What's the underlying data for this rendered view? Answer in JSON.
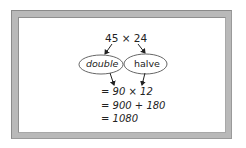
{
  "diagram": {
    "expression": "45 × 24",
    "operations": [
      {
        "label": "double",
        "applies_to": "45"
      },
      {
        "label": "halve",
        "applies_to": "24"
      }
    ],
    "steps": [
      "= 90 × 12",
      "= 900 + 180",
      "= 1080"
    ]
  },
  "colors": {
    "frame": "#b9b9b9",
    "ink": "#222222",
    "background": "#ffffff"
  }
}
